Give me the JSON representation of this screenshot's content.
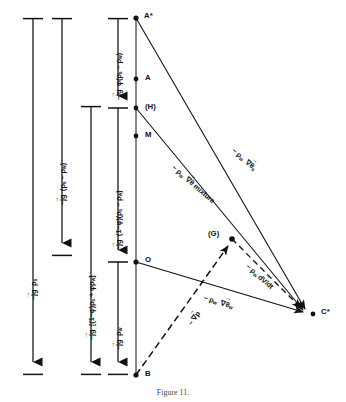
{
  "figure": {
    "type": "vector-force-diagram",
    "caption": "Figure 11.",
    "colors": {
      "ink": "#111111",
      "background": "#ffffff"
    }
  },
  "scale_bars": [
    {
      "id": "bar-jg-rho-s",
      "label": "−jg ρ",
      "sub": "s",
      "x": 33,
      "top": 18,
      "bottom": 375,
      "cap_top": true,
      "cap_bottom": true,
      "arrow": "down",
      "label_y": 300
    },
    {
      "id": "bar-jg-rho-s-minus-rho-w",
      "label": "−jg (ρ",
      "sub": "s",
      "label2": "− ρ",
      "sub2": "w",
      "label3": ")",
      "x": 62,
      "top": 18,
      "bottom": 255,
      "cap_top": true,
      "cap_bottom": true,
      "arrow": "down",
      "label_y": 188
    },
    {
      "id": "bar-jg-bracket-mixture",
      "label": "−jg [(1−φ)ρ",
      "sub": "s",
      "label2": "+ φρ",
      "sub2": "w",
      "label3": "]",
      "x": 91,
      "top": 106,
      "bottom": 375,
      "cap_top": true,
      "cap_bottom": true,
      "arrow": "down",
      "label_y": 322
    },
    {
      "id": "bar-jg-phi-rho-s-minus-rho-w",
      "x": 118,
      "top": 18,
      "bottom": 108,
      "cap_top": true,
      "cap_bottom": true,
      "arrow": "down",
      "label": "−jg φ(ρ",
      "sub": "s",
      "label2": "− ρ",
      "sub2": "w",
      "label3": ")",
      "label_y": 98
    },
    {
      "id": "bar-jg-one-minus-phi",
      "x": 118,
      "top": 108,
      "bottom": 262,
      "cap_top": false,
      "cap_bottom": true,
      "arrow": "down",
      "label": "−jg (1−φ)(ρ",
      "sub": "s",
      "label2": "− ρ",
      "sub2": "w",
      "label3": ")",
      "label_y": 245
    },
    {
      "id": "bar-jg-rho-w",
      "x": 118,
      "top": 262,
      "bottom": 375,
      "cap_top": false,
      "cap_bottom": true,
      "arrow": "down",
      "label": "−jg ρ",
      "sub": "w",
      "label_y": 345
    }
  ],
  "points": [
    {
      "id": "A-star",
      "label": "A*",
      "x": 136,
      "y": 18,
      "lx": 144,
      "ly": 11
    },
    {
      "id": "A",
      "label": "A",
      "x": 136,
      "y": 79,
      "lx": 145,
      "ly": 73
    },
    {
      "id": "H",
      "label": "(H)",
      "x": 136,
      "y": 108,
      "lx": 145,
      "ly": 102
    },
    {
      "id": "M",
      "label": "M",
      "x": 136,
      "y": 136,
      "lx": 145,
      "ly": 130
    },
    {
      "id": "O",
      "label": "O",
      "x": 136,
      "y": 262,
      "lx": 145,
      "ly": 255
    },
    {
      "id": "B",
      "label": "B",
      "x": 136,
      "y": 375,
      "lx": 145,
      "ly": 370
    },
    {
      "id": "G",
      "label": "(G)",
      "x": 232,
      "y": 239,
      "lx": 209,
      "ly": 230
    },
    {
      "id": "C-star",
      "label": "C*",
      "x": 313,
      "y": 314,
      "lx": 321,
      "ly": 308
    }
  ],
  "vectors": [
    {
      "id": "vec-rho-w-grad-theta-s",
      "from": "A-star",
      "to": "C-star",
      "style": "solid",
      "arrow": true,
      "label_pre": "− ρ",
      "label_sub": "w",
      "label_vec": "∇θ",
      "label_vsub": "s",
      "label_x": 236,
      "label_y": 146,
      "label_rot": 41
    },
    {
      "id": "vec-rho-w-grad-theta-mixture",
      "from": "H",
      "to": "C-star",
      "style": "solid",
      "arrow": true,
      "label_pre": "− ρ",
      "label_sub": "w",
      "label_vec": "∇θ",
      "label_post": " mixture",
      "label_x": 178,
      "label_y": 165,
      "label_rot": 41
    },
    {
      "id": "vec-rho-w-grad-theta-w",
      "from": "O",
      "to": "C-star",
      "style": "solid",
      "arrow": true,
      "label_pre": "− ρ",
      "label_sub": "w",
      "label_vec": "∇θ",
      "label_vsub": "w",
      "label_x": 206,
      "label_y": 294,
      "label_rot": 17
    },
    {
      "id": "vec-rho-w-dv-dt",
      "from": "G",
      "to": "C-star",
      "style": "dashed",
      "arrow": true,
      "label_pre": "− ρ",
      "label_sub": "w",
      "label_vec": "d",
      "label_post": "V/dt",
      "label_x": 252,
      "label_y": 264,
      "label_rot": 41
    },
    {
      "id": "vec-minus-grad-p",
      "from": "B",
      "to": "G",
      "style": "dashed",
      "arrow": true,
      "label_pre": "− ",
      "label_vec": "∇",
      "label_post": "p",
      "label_x": 188,
      "label_y": 320,
      "label_rot": -57
    }
  ],
  "caption_text": "Figure 11."
}
